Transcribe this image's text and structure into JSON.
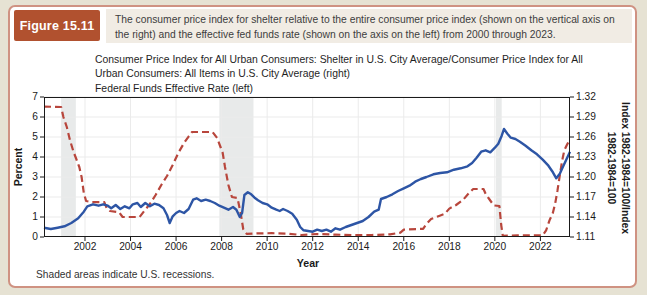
{
  "header": {
    "figure_label": "Figure 15.11",
    "caption": "The consumer price index for shelter relative to the entire consumer price index (shown on the vertical axis on the right) and the effective fed funds rate (shown on the axis on the left) from 2000 through 2023."
  },
  "legend": {
    "items": [
      {
        "label": "Consumer Price Index for All Urban Consumers: Shelter in U.S. City Average/Consumer Price Index for All Urban Consumers: All Items in U.S. City Average (right)",
        "color": "#2d55a5",
        "style": "solid"
      },
      {
        "label": "Federal Funds Effective Rate (left)",
        "color": "#b8463c",
        "style": "dashed"
      }
    ]
  },
  "footnote": "Shaded areas indicate U.S. recessions.",
  "colors": {
    "page_bg": "#e6e2d3",
    "card_bg": "#ffffff",
    "card_border": "#cf9282",
    "figure_box_bg": "#b1512f",
    "figure_box_text": "#ffffff",
    "caption_bg": "#f1ece4",
    "blue_line": "#2d55a5",
    "red_line": "#b8463c",
    "recession_band": "#e4e6e6",
    "grid": "#ebebeb",
    "axis": "#1a1a1a"
  },
  "chart_data": {
    "type": "line",
    "xlabel": "Year",
    "ylabel_left": "Percent",
    "ylabel_right_lines": [
      "Index 1982-1984=100/Index",
      "1982-1984=100"
    ],
    "x_range": [
      2000.2,
      2023.3
    ],
    "y_left_range": [
      0,
      7
    ],
    "y_right_range": [
      1.11,
      1.32
    ],
    "x_ticks": [
      2002,
      2004,
      2006,
      2008,
      2010,
      2012,
      2014,
      2016,
      2018,
      2020,
      2022
    ],
    "y_left_ticks": [
      0,
      1,
      2,
      3,
      4,
      5,
      6,
      7
    ],
    "y_right_ticks": [
      1.11,
      1.14,
      1.17,
      1.2,
      1.23,
      1.26,
      1.29,
      1.32
    ],
    "grid": true,
    "legend_position": "top-left",
    "recession_bands": [
      [
        2000.95,
        2001.6
      ],
      [
        2007.9,
        2009.4
      ],
      [
        2020.05,
        2020.3
      ]
    ],
    "series": [
      {
        "name": "CPI Shelter / CPI All Items ratio",
        "axis": "right",
        "color": "#2d55a5",
        "style": "solid",
        "points": [
          [
            2000.2,
            1.124
          ],
          [
            2000.5,
            1.122
          ],
          [
            2000.8,
            1.124
          ],
          [
            2001.1,
            1.126
          ],
          [
            2001.4,
            1.131
          ],
          [
            2001.7,
            1.138
          ],
          [
            2001.95,
            1.148
          ],
          [
            2002.1,
            1.156
          ],
          [
            2002.35,
            1.159
          ],
          [
            2002.6,
            1.157
          ],
          [
            2002.8,
            1.159
          ],
          [
            2003.0,
            1.157
          ],
          [
            2003.15,
            1.153
          ],
          [
            2003.35,
            1.158
          ],
          [
            2003.55,
            1.152
          ],
          [
            2003.75,
            1.156
          ],
          [
            2003.95,
            1.153
          ],
          [
            2004.1,
            1.159
          ],
          [
            2004.3,
            1.161
          ],
          [
            2004.45,
            1.155
          ],
          [
            2004.65,
            1.161
          ],
          [
            2004.85,
            1.156
          ],
          [
            2005.05,
            1.16
          ],
          [
            2005.25,
            1.158
          ],
          [
            2005.45,
            1.153
          ],
          [
            2005.6,
            1.143
          ],
          [
            2005.72,
            1.131
          ],
          [
            2005.85,
            1.141
          ],
          [
            2006.0,
            1.146
          ],
          [
            2006.15,
            1.149
          ],
          [
            2006.35,
            1.146
          ],
          [
            2006.55,
            1.152
          ],
          [
            2006.75,
            1.166
          ],
          [
            2006.9,
            1.168
          ],
          [
            2007.1,
            1.164
          ],
          [
            2007.3,
            1.166
          ],
          [
            2007.5,
            1.164
          ],
          [
            2007.7,
            1.161
          ],
          [
            2007.9,
            1.157
          ],
          [
            2008.1,
            1.154
          ],
          [
            2008.3,
            1.151
          ],
          [
            2008.5,
            1.155
          ],
          [
            2008.65,
            1.151
          ],
          [
            2008.8,
            1.14
          ],
          [
            2008.9,
            1.146
          ],
          [
            2009.0,
            1.173
          ],
          [
            2009.15,
            1.177
          ],
          [
            2009.3,
            1.174
          ],
          [
            2009.45,
            1.169
          ],
          [
            2009.6,
            1.165
          ],
          [
            2009.8,
            1.161
          ],
          [
            2010.0,
            1.159
          ],
          [
            2010.2,
            1.154
          ],
          [
            2010.4,
            1.151
          ],
          [
            2010.55,
            1.149
          ],
          [
            2010.7,
            1.152
          ],
          [
            2010.9,
            1.149
          ],
          [
            2011.1,
            1.145
          ],
          [
            2011.3,
            1.136
          ],
          [
            2011.45,
            1.125
          ],
          [
            2011.6,
            1.12
          ],
          [
            2011.8,
            1.119
          ],
          [
            2012.0,
            1.118
          ],
          [
            2012.2,
            1.121
          ],
          [
            2012.4,
            1.119
          ],
          [
            2012.6,
            1.121
          ],
          [
            2012.8,
            1.118
          ],
          [
            2013.0,
            1.123
          ],
          [
            2013.2,
            1.121
          ],
          [
            2013.45,
            1.125
          ],
          [
            2013.7,
            1.128
          ],
          [
            2013.95,
            1.131
          ],
          [
            2014.2,
            1.134
          ],
          [
            2014.45,
            1.14
          ],
          [
            2014.7,
            1.148
          ],
          [
            2014.9,
            1.151
          ],
          [
            2015.0,
            1.167
          ],
          [
            2015.25,
            1.17
          ],
          [
            2015.5,
            1.174
          ],
          [
            2015.75,
            1.179
          ],
          [
            2016.0,
            1.183
          ],
          [
            2016.25,
            1.187
          ],
          [
            2016.5,
            1.193
          ],
          [
            2016.75,
            1.197
          ],
          [
            2017.0,
            1.2
          ],
          [
            2017.3,
            1.204
          ],
          [
            2017.6,
            1.206
          ],
          [
            2017.9,
            1.207
          ],
          [
            2018.2,
            1.211
          ],
          [
            2018.5,
            1.213
          ],
          [
            2018.8,
            1.216
          ],
          [
            2019.0,
            1.221
          ],
          [
            2019.2,
            1.229
          ],
          [
            2019.4,
            1.238
          ],
          [
            2019.6,
            1.24
          ],
          [
            2019.8,
            1.237
          ],
          [
            2020.0,
            1.244
          ],
          [
            2020.15,
            1.25
          ],
          [
            2020.3,
            1.262
          ],
          [
            2020.4,
            1.272
          ],
          [
            2020.55,
            1.265
          ],
          [
            2020.7,
            1.259
          ],
          [
            2020.9,
            1.257
          ],
          [
            2021.1,
            1.253
          ],
          [
            2021.35,
            1.247
          ],
          [
            2021.6,
            1.24
          ],
          [
            2021.85,
            1.234
          ],
          [
            2022.1,
            1.226
          ],
          [
            2022.35,
            1.217
          ],
          [
            2022.55,
            1.207
          ],
          [
            2022.7,
            1.198
          ],
          [
            2022.85,
            1.205
          ],
          [
            2023.0,
            1.216
          ],
          [
            2023.15,
            1.227
          ],
          [
            2023.3,
            1.238
          ]
        ]
      },
      {
        "name": "Federal Funds Effective Rate",
        "axis": "left",
        "color": "#b8463c",
        "style": "dashed",
        "points": [
          [
            2000.2,
            6.52
          ],
          [
            2000.95,
            6.5
          ],
          [
            2001.05,
            6.0
          ],
          [
            2001.2,
            5.5
          ],
          [
            2001.35,
            4.8
          ],
          [
            2001.5,
            4.25
          ],
          [
            2001.62,
            3.9
          ],
          [
            2001.75,
            3.5
          ],
          [
            2001.85,
            3.0
          ],
          [
            2001.95,
            2.2
          ],
          [
            2002.05,
            1.8
          ],
          [
            2002.3,
            1.74
          ],
          [
            2002.85,
            1.74
          ],
          [
            2002.95,
            1.45
          ],
          [
            2003.1,
            1.3
          ],
          [
            2003.5,
            1.24
          ],
          [
            2003.65,
            1.0
          ],
          [
            2004.4,
            1.0
          ],
          [
            2004.6,
            1.3
          ],
          [
            2004.85,
            1.65
          ],
          [
            2005.1,
            2.1
          ],
          [
            2005.35,
            2.6
          ],
          [
            2005.6,
            3.05
          ],
          [
            2005.85,
            3.6
          ],
          [
            2006.1,
            4.2
          ],
          [
            2006.35,
            4.7
          ],
          [
            2006.55,
            5.02
          ],
          [
            2006.7,
            5.25
          ],
          [
            2007.6,
            5.25
          ],
          [
            2007.8,
            4.95
          ],
          [
            2007.95,
            4.5
          ],
          [
            2008.05,
            4.2
          ],
          [
            2008.15,
            3.5
          ],
          [
            2008.3,
            2.6
          ],
          [
            2008.45,
            2.0
          ],
          [
            2008.7,
            1.95
          ],
          [
            2008.85,
            1.1
          ],
          [
            2008.95,
            0.4
          ],
          [
            2009.1,
            0.16
          ],
          [
            2009.6,
            0.18
          ],
          [
            2010.2,
            0.19
          ],
          [
            2010.9,
            0.17
          ],
          [
            2011.5,
            0.1
          ],
          [
            2012.2,
            0.15
          ],
          [
            2013.0,
            0.12
          ],
          [
            2013.8,
            0.09
          ],
          [
            2014.6,
            0.1
          ],
          [
            2015.4,
            0.13
          ],
          [
            2015.85,
            0.22
          ],
          [
            2016.0,
            0.37
          ],
          [
            2016.85,
            0.41
          ],
          [
            2017.0,
            0.66
          ],
          [
            2017.2,
            0.9
          ],
          [
            2017.55,
            1.05
          ],
          [
            2017.8,
            1.16
          ],
          [
            2018.0,
            1.42
          ],
          [
            2018.3,
            1.6
          ],
          [
            2018.6,
            1.85
          ],
          [
            2018.85,
            2.18
          ],
          [
            2019.05,
            2.4
          ],
          [
            2019.5,
            2.4
          ],
          [
            2019.6,
            2.15
          ],
          [
            2019.75,
            1.9
          ],
          [
            2019.95,
            1.58
          ],
          [
            2020.2,
            1.55
          ],
          [
            2020.28,
            0.6
          ],
          [
            2020.35,
            0.06
          ],
          [
            2021.0,
            0.08
          ],
          [
            2022.1,
            0.08
          ],
          [
            2022.25,
            0.33
          ],
          [
            2022.4,
            0.83
          ],
          [
            2022.55,
            1.21
          ],
          [
            2022.65,
            1.68
          ],
          [
            2022.75,
            2.33
          ],
          [
            2022.85,
            3.08
          ],
          [
            2022.95,
            3.78
          ],
          [
            2023.05,
            4.33
          ],
          [
            2023.15,
            4.57
          ],
          [
            2023.3,
            4.9
          ]
        ]
      }
    ]
  }
}
